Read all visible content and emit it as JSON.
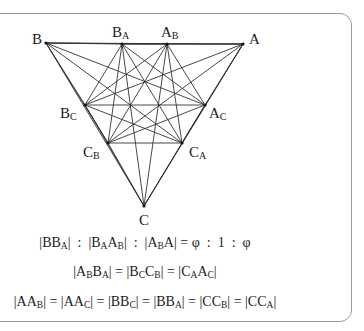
{
  "points": [
    {
      "id": "B",
      "label": "B",
      "sub": "",
      "x": 46,
      "y": 43,
      "lx": 32,
      "ly": 32
    },
    {
      "id": "BA",
      "label": "B",
      "sub": "A",
      "x": 122,
      "y": 44,
      "lx": 112,
      "ly": 25
    },
    {
      "id": "AB",
      "label": "A",
      "sub": "B",
      "x": 167,
      "y": 44,
      "lx": 161,
      "ly": 25
    },
    {
      "id": "A",
      "label": "A",
      "sub": "",
      "x": 243,
      "y": 44,
      "lx": 249,
      "ly": 32
    },
    {
      "id": "AC",
      "label": "A",
      "sub": "C",
      "x": 205,
      "y": 105,
      "lx": 209,
      "ly": 106
    },
    {
      "id": "CA",
      "label": "C",
      "sub": "A",
      "x": 182,
      "y": 143,
      "lx": 189,
      "ly": 145
    },
    {
      "id": "C",
      "label": "C",
      "sub": "",
      "x": 144,
      "y": 206,
      "lx": 139,
      "ly": 213
    },
    {
      "id": "CB",
      "label": "C",
      "sub": "B",
      "x": 108,
      "y": 143,
      "lx": 83,
      "ly": 145
    },
    {
      "id": "BC",
      "label": "B",
      "sub": "C",
      "x": 85,
      "y": 105,
      "lx": 60,
      "ly": 106
    }
  ],
  "edge_mode": "complete",
  "line_color": "#333333",
  "formulas": [
    {
      "text": "|BB_A| : |B_AA_B| : |A_BA| = φ : 1 : φ",
      "html_parts": [
        [
          "|BB",
          ""
        ],
        [
          "A",
          ""
        ],
        [
          "| : |B",
          ""
        ],
        [
          "A",
          ""
        ],
        [
          "A",
          ""
        ],
        [
          "B",
          ""
        ],
        [
          "| : |A",
          ""
        ],
        [
          "B",
          ""
        ],
        [
          "A| = φ : 1 : φ",
          ""
        ]
      ],
      "y": 235
    },
    {
      "text": "|A_BB_A| = |B_CC_B| = |C_AA_C|",
      "y": 264
    },
    {
      "text": "|AA_B| = |AA_C| = |BB_C| = |BB_A| = |CC_B| = |CC_A|",
      "y": 294
    }
  ],
  "formula_display": [
    [
      [
        "|BB",
        0
      ],
      [
        "A",
        1
      ],
      [
        "|  :  |B",
        0
      ],
      [
        "A",
        1
      ],
      [
        "A",
        0
      ],
      [
        "B",
        1
      ],
      [
        "|  :  |A",
        0
      ],
      [
        "B",
        1
      ],
      [
        "A| = ",
        0
      ],
      [
        "φ",
        0
      ],
      [
        "  :  1  :  ",
        0
      ],
      [
        "φ",
        0
      ]
    ],
    [
      [
        "|A",
        0
      ],
      [
        "B",
        1
      ],
      [
        "B",
        0
      ],
      [
        "A",
        1
      ],
      [
        "| = |B",
        0
      ],
      [
        "C",
        1
      ],
      [
        "C",
        0
      ],
      [
        "B",
        1
      ],
      [
        "| = |C",
        0
      ],
      [
        "A",
        1
      ],
      [
        "A",
        0
      ],
      [
        "C",
        1
      ],
      [
        "|",
        0
      ]
    ],
    [
      [
        "|AA",
        0
      ],
      [
        "B",
        1
      ],
      [
        "| = |AA",
        0
      ],
      [
        "C",
        1
      ],
      [
        "| = |BB",
        0
      ],
      [
        "C",
        1
      ],
      [
        "| = |BB",
        0
      ],
      [
        "A",
        1
      ],
      [
        "| = |CC",
        0
      ],
      [
        "B",
        1
      ],
      [
        "| = |CC",
        0
      ],
      [
        "A",
        1
      ],
      [
        "|",
        0
      ]
    ]
  ]
}
